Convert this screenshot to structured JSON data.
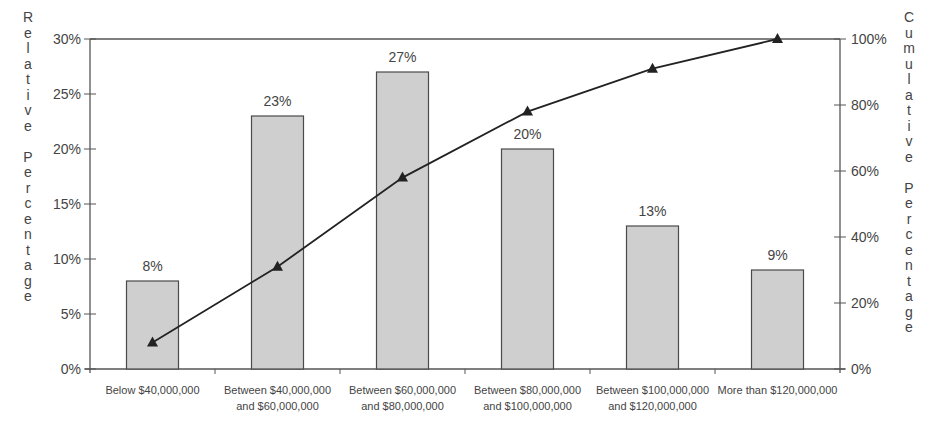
{
  "chart_data": {
    "type": "bar",
    "title": "",
    "categories": [
      [
        "Below $40,000,000"
      ],
      [
        "Between $40,000,000",
        "and $60,000,000"
      ],
      [
        "Between $60,000,000",
        "and $80,000,000"
      ],
      [
        "Between $80,000,000",
        "and $100,000,000"
      ],
      [
        "Between $100,000,000",
        "and $120,000,000"
      ],
      [
        "More than $120,000,000"
      ]
    ],
    "series": [
      {
        "name": "Relative Percentage",
        "type": "bar",
        "axis": "left",
        "values": [
          8,
          23,
          27,
          20,
          13,
          9
        ],
        "data_labels": [
          "8%",
          "23%",
          "27%",
          "20%",
          "13%",
          "9%"
        ],
        "color": "#cfcfcf"
      },
      {
        "name": "Cumulative Percentage",
        "type": "line",
        "axis": "right",
        "marker": "triangle",
        "values": [
          8,
          31,
          58,
          78,
          91,
          100
        ],
        "color": "#222222"
      }
    ],
    "xlabel": "",
    "ylabel": "Relative Percentage",
    "y2label": "Cumulative Percentage",
    "ylim": [
      0,
      30
    ],
    "y2lim": [
      0,
      100
    ],
    "yticks": [
      "0%",
      "5%",
      "10%",
      "15%",
      "20%",
      "25%",
      "30%"
    ],
    "y2ticks": [
      "0%",
      "20%",
      "40%",
      "60%",
      "80%",
      "100%"
    ],
    "grid": false,
    "legend": null
  },
  "axes": {
    "left_title": "Relative Percentage",
    "right_title": "Cumulative Percentage"
  }
}
